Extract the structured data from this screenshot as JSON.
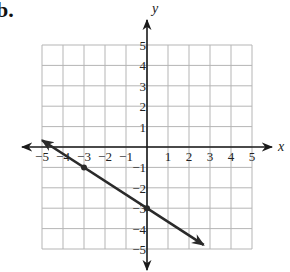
{
  "problem_label": "b.",
  "chart_data": {
    "type": "line",
    "title": "",
    "xlabel": "x",
    "ylabel": "y",
    "xlim": [
      -5,
      5
    ],
    "ylim": [
      -5,
      5
    ],
    "grid": true,
    "x_ticks": [
      "-5",
      "-4",
      "-3",
      "-2",
      "-1",
      "1",
      "2",
      "3",
      "4",
      "5"
    ],
    "y_ticks": [
      "5",
      "4",
      "3",
      "2",
      "1",
      "-1",
      "-2",
      "-3",
      "-4",
      "-5"
    ],
    "series": [
      {
        "name": "line",
        "equation": "y = -2/3 x - 3",
        "points": [
          {
            "x": -3,
            "y": -1
          },
          {
            "x": 0,
            "y": -3
          }
        ],
        "arrow_start": {
          "x": -5,
          "y": 0.33
        },
        "arrow_end": {
          "x": 2.7,
          "y": -4.8
        }
      }
    ],
    "colors": {
      "grid": "#b5b5b5",
      "axis": "#1a1a1a",
      "line": "#2a2a2a"
    }
  }
}
